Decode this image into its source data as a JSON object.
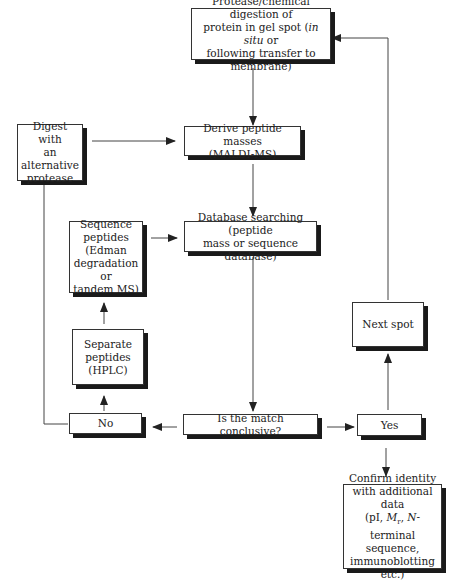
{
  "diagram": {
    "type": "flowchart",
    "nodes": {
      "digest": {
        "lines": [
          "Protease/chemical digestion of",
          "protein in gel spot (in situ or",
          "following transfer to membrane)"
        ]
      },
      "alternative": {
        "lines": [
          "Digest with",
          "an alternative",
          "protease"
        ]
      },
      "masses": {
        "lines": [
          "Derive peptide masses",
          "(MALDI-MS)"
        ]
      },
      "sequence": {
        "lines": [
          "Sequence",
          "peptides",
          "(Edman",
          "degradation or",
          "tandem MS)"
        ]
      },
      "database": {
        "lines": [
          "Database searching (peptide",
          "mass or sequence database)"
        ]
      },
      "separate": {
        "lines": [
          "Separate",
          "peptides",
          "(HPLC)"
        ]
      },
      "no": {
        "label": "No"
      },
      "conclusive": {
        "label": "Is the match conclusive?"
      },
      "yes": {
        "label": "Yes"
      },
      "next": {
        "label": "Next spot"
      },
      "confirm": {
        "lines": [
          "Confirm identity",
          "with additional data",
          "(pI, Mr, N-terminal",
          "sequence,",
          "immunoblotting",
          "etc.)"
        ]
      }
    },
    "edges": [
      {
        "from": "digest",
        "to": "masses"
      },
      {
        "from": "alternative",
        "to": "masses"
      },
      {
        "from": "masses",
        "to": "database"
      },
      {
        "from": "sequence",
        "to": "database"
      },
      {
        "from": "database",
        "to": "conclusive"
      },
      {
        "from": "conclusive",
        "to": "no"
      },
      {
        "from": "conclusive",
        "to": "yes"
      },
      {
        "from": "no",
        "to": "separate"
      },
      {
        "from": "separate",
        "to": "sequence"
      },
      {
        "from": "no",
        "to": "alternative"
      },
      {
        "from": "yes",
        "to": "next"
      },
      {
        "from": "next",
        "to": "digest"
      },
      {
        "from": "yes",
        "to": "confirm"
      }
    ]
  }
}
